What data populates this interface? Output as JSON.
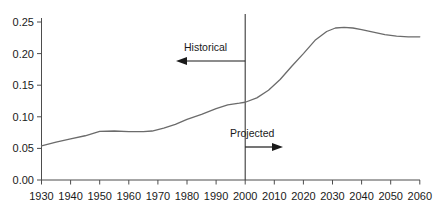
{
  "chart_data": {
    "type": "line",
    "title": "",
    "subtitle": "",
    "xlabel": "",
    "ylabel": "",
    "xlim": [
      1930,
      2060
    ],
    "ylim": [
      0.0,
      0.26
    ],
    "grid": false,
    "legend": null,
    "x_ticks": [
      "1930",
      "1940",
      "1950",
      "1960",
      "1970",
      "1980",
      "1990",
      "2000",
      "2010",
      "2020",
      "2030",
      "2040",
      "2050",
      "2060"
    ],
    "y_ticks": [
      "0.00",
      "0.05",
      "0.10",
      "0.15",
      "0.20",
      "0.25"
    ],
    "series": [
      {
        "name": "ratio",
        "x": [
          1930,
          1935,
          1940,
          1945,
          1950,
          1955,
          1960,
          1965,
          1968,
          1972,
          1976,
          1980,
          1985,
          1990,
          1994,
          1998,
          2000,
          2004,
          2008,
          2012,
          2016,
          2020,
          2024,
          2028,
          2031,
          2034,
          2037,
          2040,
          2044,
          2048,
          2052,
          2056,
          2060
        ],
        "y": [
          0.054,
          0.06,
          0.065,
          0.07,
          0.077,
          0.0775,
          0.0765,
          0.0765,
          0.0775,
          0.082,
          0.088,
          0.096,
          0.104,
          0.113,
          0.119,
          0.1215,
          0.123,
          0.13,
          0.142,
          0.159,
          0.18,
          0.2,
          0.221,
          0.235,
          0.2405,
          0.2415,
          0.2405,
          0.238,
          0.234,
          0.23,
          0.2275,
          0.2265,
          0.2265
        ]
      }
    ],
    "annotations": [
      {
        "id": "historical",
        "label": "Historical",
        "arrow": "left"
      },
      {
        "id": "projected",
        "label": "Projected",
        "arrow": "right"
      },
      {
        "id": "divider",
        "label": "",
        "at_x": 2000
      }
    ]
  },
  "colors": {
    "line": "#6b6b6b",
    "axis": "#4d4d4d",
    "text": "#1a1a1a",
    "divider": "#3a3a3a",
    "background": "#ffffff"
  }
}
